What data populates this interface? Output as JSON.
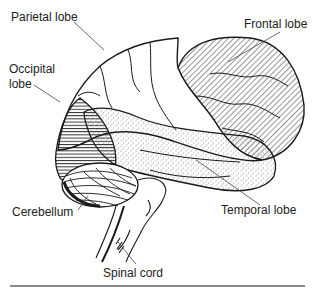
{
  "figure": {
    "labels": {
      "parietal": "Parietal lobe",
      "frontal": "Frontal lobe",
      "occipital_line1": "Occipital",
      "occipital_line2": "lobe",
      "cerebellum": "Cerebellum",
      "temporal": "Temporal lobe",
      "spinal": "Spinal cord"
    },
    "colors": {
      "ink": "#1a1a1a",
      "leader": "#444444",
      "rule": "#8a8a8a",
      "background": "#ffffff"
    }
  }
}
